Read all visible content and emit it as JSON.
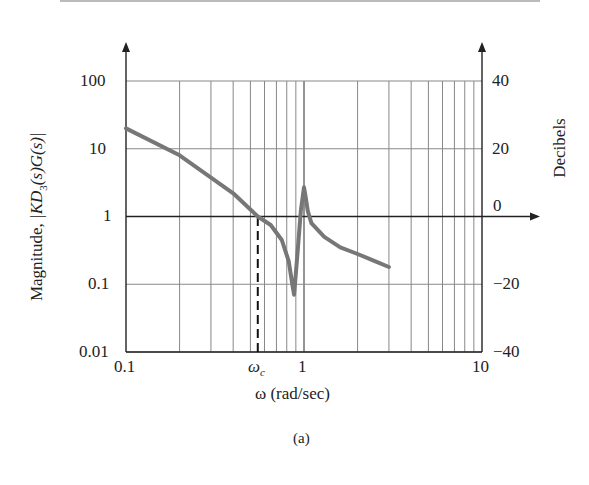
{
  "chart_data": {
    "type": "line",
    "title": "",
    "caption": "(a)",
    "xlabel": "ω (rad/sec)",
    "ylabel": "Magnitude, |KD3(s)G(s)|",
    "ylabel_right": "Decibels",
    "xscale": "log",
    "yscale": "log",
    "xlim": [
      0.1,
      10
    ],
    "ylim": [
      0.01,
      100
    ],
    "ylim_right_db": [
      -40,
      40
    ],
    "grid": true,
    "x_ticks": [
      "0.1",
      "ωc",
      "1",
      "10"
    ],
    "y_ticks": [
      "0.01",
      "0.1",
      "1",
      "10",
      "100"
    ],
    "y_ticks_right": [
      "−40",
      "−20",
      "0",
      "20",
      "40"
    ],
    "annotations": [
      {
        "type": "dashed-vertical",
        "x_label": "ωc",
        "x": 0.55,
        "from_y": 0.01,
        "to_y": 1
      }
    ],
    "series": [
      {
        "name": "|KD3(s)G(s)|",
        "color": "#777777",
        "x": [
          0.1,
          0.2,
          0.4,
          0.55,
          0.65,
          0.75,
          0.82,
          0.86,
          0.88,
          0.92,
          0.96,
          1.0,
          1.02,
          1.05,
          1.1,
          1.3,
          1.6,
          2.0,
          2.5,
          3.0
        ],
        "y": [
          20,
          8,
          2.2,
          1.0,
          0.75,
          0.45,
          0.22,
          0.1,
          0.07,
          0.3,
          1.2,
          2.7,
          2.0,
          1.2,
          0.8,
          0.5,
          0.35,
          0.28,
          0.22,
          0.18
        ]
      }
    ]
  },
  "labels": {
    "y_left_title": "Magnitude, ",
    "y_left_title_math": "|KD3(s)G(s)|",
    "y_right_title": "Decibels",
    "x_title": "ω (rad/sec)",
    "caption": "(a)",
    "y100": "100",
    "y10": "10",
    "y1": "1",
    "y01": "0.1",
    "y001": "0.01",
    "db40": "40",
    "db20": "20",
    "db0": "0",
    "dbm20": "−20",
    "dbm40": "−40",
    "x01": "0.1",
    "xwc": "ω",
    "xwc_sub": "c",
    "x1": "1",
    "x10": "10"
  }
}
